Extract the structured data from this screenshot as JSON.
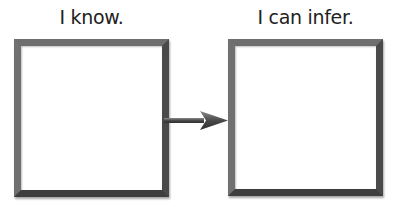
{
  "diagram": {
    "left_box": {
      "label": "I know."
    },
    "right_box": {
      "label": "I can infer."
    },
    "connector": {
      "direction": "right",
      "icon": "arrow-right-icon"
    }
  }
}
